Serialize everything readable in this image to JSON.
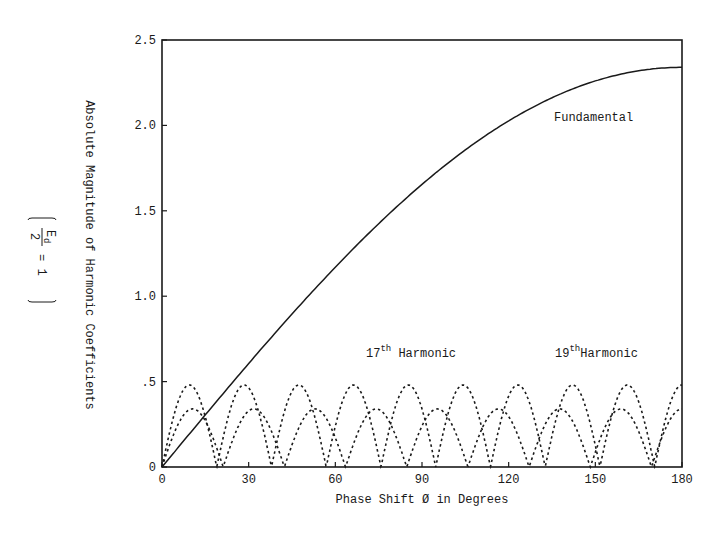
{
  "chart_data": {
    "type": "line",
    "title": "",
    "xlabel": "Phase Shift Ø in Degrees",
    "ylabel": "Absolute Magnitude of Harmonic Coefficients",
    "ylabel_note": "(Ed/2 = 1)",
    "ylabel_note_parts": {
      "numerator": "E",
      "sub": "d",
      "denominator": "2",
      "rest": "= 1"
    },
    "xlim": [
      0,
      180
    ],
    "ylim": [
      0,
      2.5
    ],
    "x_ticks": [
      0,
      30,
      60,
      90,
      120,
      150,
      180
    ],
    "x_tick_labels": [
      "0",
      "30",
      "60",
      "90",
      "120",
      "150",
      "180"
    ],
    "y_ticks": [
      0,
      0.5,
      1.0,
      1.5,
      2.0,
      2.5
    ],
    "y_tick_labels": [
      "0",
      ".5",
      "1.0",
      "1.5",
      "2.0",
      "2.5"
    ],
    "grid": false,
    "legend": "inline annotations",
    "annotations": [
      {
        "text": "Fundamental",
        "x": 142,
        "y": 2.06
      },
      {
        "text_base": "17",
        "text_sup": "th",
        "text_rest": " Harmonic",
        "x": 71,
        "y": 0.67
      },
      {
        "text_base": "19",
        "text_sup": "th",
        "text_rest": "Harmonic",
        "x": 136,
        "y": 0.67
      }
    ],
    "series": [
      {
        "name": "Fundamental",
        "style": "solid",
        "x": [
          0,
          15,
          30,
          45,
          60,
          75,
          90,
          105,
          120,
          135,
          150,
          165,
          180
        ],
        "values": [
          0.0,
          0.31,
          0.61,
          0.9,
          1.17,
          1.42,
          1.65,
          1.86,
          2.03,
          2.16,
          2.26,
          2.32,
          2.34
        ]
      },
      {
        "name": "17th Harmonic",
        "style": "dashed",
        "peak": 0.34,
        "zero_spacing_deg": 21.18,
        "x": [
          0,
          10.6,
          21.2,
          31.8,
          42.4,
          52.9,
          63.5,
          74.1,
          84.7,
          95.3,
          105.9,
          116.5,
          127.1,
          137.6,
          148.2,
          158.8,
          169.4,
          180
        ],
        "values": [
          0,
          0.34,
          0,
          0.34,
          0,
          0.34,
          0,
          0.34,
          0,
          0.34,
          0,
          0.34,
          0,
          0.34,
          0,
          0.34,
          0,
          0.35
        ]
      },
      {
        "name": "19th Harmonic",
        "style": "dashed",
        "peak": 0.48,
        "zero_spacing_deg": 18.95,
        "x": [
          0,
          9.5,
          18.9,
          28.4,
          37.9,
          47.4,
          56.8,
          66.3,
          75.8,
          85.3,
          94.7,
          104.2,
          113.7,
          123.2,
          132.6,
          142.1,
          151.6,
          161.1,
          170.5,
          180
        ],
        "values": [
          0,
          0.48,
          0,
          0.48,
          0,
          0.48,
          0,
          0.48,
          0,
          0.48,
          0,
          0.48,
          0,
          0.48,
          0,
          0.48,
          0,
          0.48,
          0,
          0.5
        ]
      }
    ]
  }
}
